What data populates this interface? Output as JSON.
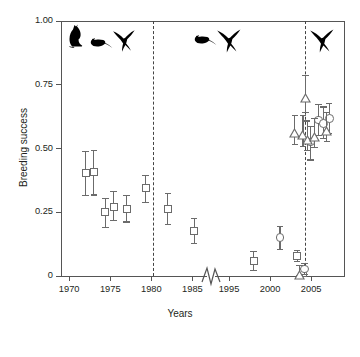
{
  "chart_data": {
    "type": "scatter",
    "title": "",
    "xlabel": "Years",
    "ylabel": "Breeding success",
    "ylim": [
      0,
      1.0
    ],
    "xlim": [
      1969,
      2009
    ],
    "grid": false,
    "legend_position": "none",
    "axis_break": {
      "present": true,
      "from": 1986.5,
      "to": 1993.5
    },
    "y_ticks": [
      "0",
      "0.25",
      "0.50",
      "0.75",
      "1.00"
    ],
    "y_tick_values": [
      0,
      0.25,
      0.5,
      0.75,
      1.0
    ],
    "x_ticks": [
      "1970",
      "1975",
      "1980",
      "1985",
      "1995",
      "2000",
      "2005"
    ],
    "x_tick_values": [
      1970,
      1975,
      1980,
      1985,
      1995,
      2000,
      2005
    ],
    "event_lines": [
      {
        "label": "cat-eradication-line",
        "x": 1980.3,
        "style": "dashed"
      },
      {
        "label": "rat-eradication-line",
        "x": 2004.3,
        "style": "dashed"
      }
    ],
    "series": [
      {
        "name": "Breeding success (squares)",
        "marker": "open-square",
        "points": [
          {
            "x": 1972.0,
            "y": 0.405,
            "err_low": 0.09,
            "err_high": 0.085
          },
          {
            "x": 1973.0,
            "y": 0.408,
            "err_low": 0.09,
            "err_high": 0.085
          },
          {
            "x": 1974.4,
            "y": 0.25,
            "err_low": 0.06,
            "err_high": 0.055
          },
          {
            "x": 1975.4,
            "y": 0.272,
            "err_low": 0.055,
            "err_high": 0.06
          },
          {
            "x": 1977.0,
            "y": 0.262,
            "err_low": 0.05,
            "err_high": 0.055
          },
          {
            "x": 1979.3,
            "y": 0.345,
            "err_low": 0.055,
            "err_high": 0.05
          },
          {
            "x": 1982.0,
            "y": 0.263,
            "err_low": 0.06,
            "err_high": 0.06
          },
          {
            "x": 1985.2,
            "y": 0.176,
            "err_low": 0.048,
            "err_high": 0.05
          },
          {
            "x": 1998.0,
            "y": 0.058,
            "err_low": 0.038,
            "err_high": 0.04
          },
          {
            "x": 2003.3,
            "y": 0.078,
            "err_low": 0.022,
            "err_high": 0.022
          },
          {
            "x": 2004.0,
            "y": 0.012,
            "err_low": 0.012,
            "err_high": 0.018
          }
        ]
      },
      {
        "name": "Breeding success (circles)",
        "marker": "open-circle",
        "points": [
          {
            "x": 2001.2,
            "y": 0.15,
            "err_low": 0.045,
            "err_high": 0.045
          },
          {
            "x": 2004.2,
            "y": 0.027,
            "err_low": 0.022,
            "err_high": 0.022
          },
          {
            "x": 2004.9,
            "y": 0.525,
            "err_low": 0.07,
            "err_high": 0.06
          },
          {
            "x": 2005.9,
            "y": 0.612,
            "err_low": 0.06,
            "err_high": 0.06
          },
          {
            "x": 2006.5,
            "y": 0.598,
            "err_low": 0.06,
            "err_high": 0.065
          },
          {
            "x": 2007.2,
            "y": 0.618,
            "err_low": 0.058,
            "err_high": 0.06
          }
        ]
      },
      {
        "name": "Breeding success (triangles)",
        "marker": "open-triangle",
        "points": [
          {
            "x": 2003.6,
            "y": 0.02,
            "err_low": 0.018,
            "err_high": 0.022
          },
          {
            "x": 2004.3,
            "y": 0.715,
            "err_low": 0.075,
            "err_high": 0.07
          },
          {
            "x": 2004.0,
            "y": 0.568,
            "err_low": 0.06,
            "err_high": 0.06
          },
          {
            "x": 2004.5,
            "y": 0.548,
            "err_low": 0.055,
            "err_high": 0.06
          },
          {
            "x": 2003.0,
            "y": 0.575,
            "err_low": 0.06,
            "err_high": 0.055
          },
          {
            "x": 2005.4,
            "y": 0.56,
            "err_low": 0.055,
            "err_high": 0.058
          },
          {
            "x": 2006.9,
            "y": 0.586,
            "err_low": 0.06,
            "err_high": 0.055
          }
        ]
      }
    ],
    "annotations": [
      {
        "name": "cat-silhouette",
        "period": "pre-1980",
        "species": "cat"
      },
      {
        "name": "rat-silhouette-early",
        "period": "pre-1980",
        "species": "rat"
      },
      {
        "name": "bird-silhouette-early",
        "period": "pre-1980",
        "species": "seabird"
      },
      {
        "name": "rat-silhouette-mid",
        "period": "1980-2004",
        "species": "rat"
      },
      {
        "name": "bird-silhouette-mid",
        "period": "1980-2004",
        "species": "seabird"
      },
      {
        "name": "bird-silhouette-late",
        "period": "post-2004",
        "species": "seabird"
      }
    ]
  },
  "colors": {
    "axis": "#555555",
    "marker_stroke": "#6b6b6b",
    "marker_fill": "#ffffff",
    "silhouette": "#000000",
    "event_line": "#444444",
    "text": "#231f20"
  }
}
